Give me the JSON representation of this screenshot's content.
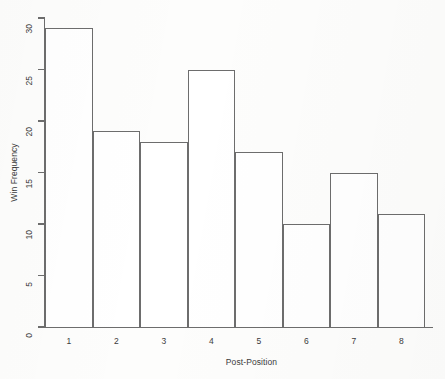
{
  "chart_data": {
    "type": "bar",
    "title": "",
    "xlabel": "Post-Position",
    "ylabel": "Win Frequency",
    "categories": [
      "1",
      "2",
      "3",
      "4",
      "5",
      "6",
      "7",
      "8"
    ],
    "values": [
      29,
      19,
      18,
      25,
      17,
      10,
      15,
      11
    ],
    "ylim": [
      0,
      30
    ],
    "yticks": [
      0,
      5,
      10,
      15,
      20,
      25,
      30
    ],
    "ytick_labels": [
      "0",
      "5",
      "10",
      "15",
      "20",
      "25",
      "30"
    ],
    "grid": false,
    "legend": false,
    "style": {
      "bar_fill": "#ffffff",
      "bar_stroke": "#6d6d6d",
      "axis_color": "#6d6d6d",
      "text_color": "#3b3b3b",
      "background": "#fdfdfc"
    }
  }
}
